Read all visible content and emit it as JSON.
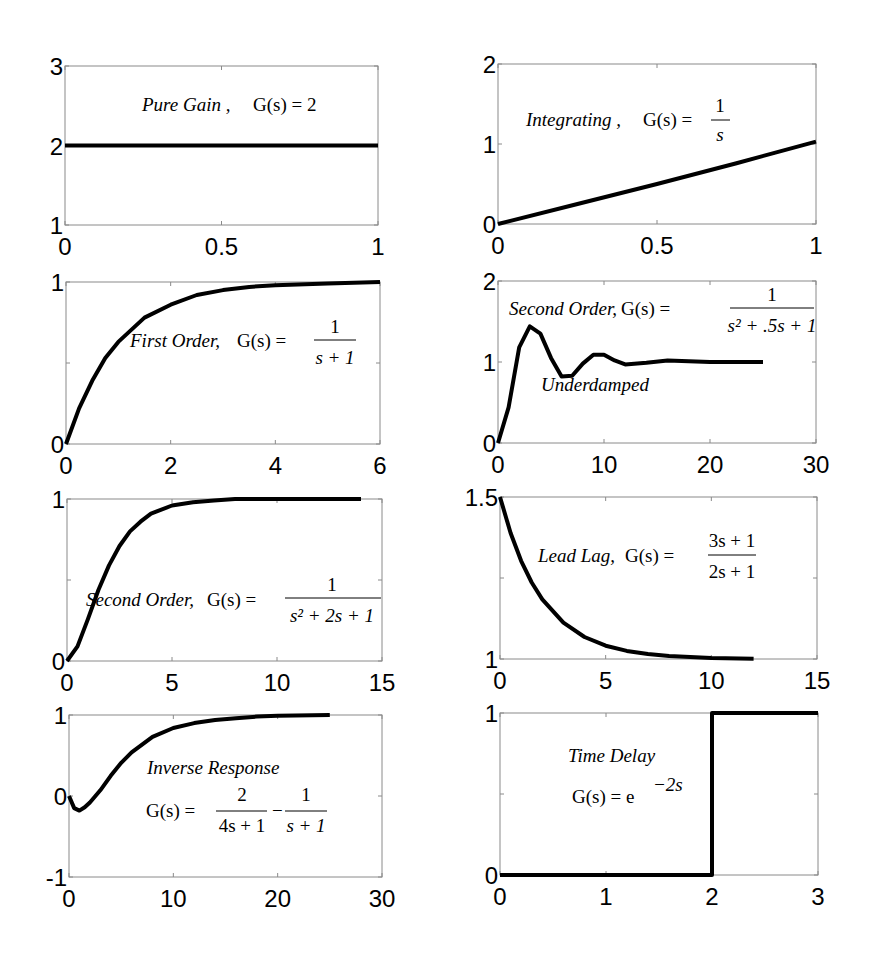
{
  "figure": {
    "line_color": "#000000",
    "axes_color": "#8a8a8a"
  },
  "chart_data": [
    {
      "id": "pure-gain",
      "type": "line",
      "title": "Pure Gain, G(s) = 2",
      "annotation": {
        "label": "Pure Gain ,",
        "formula": "G(s) = 2"
      },
      "xlim": [
        0,
        1
      ],
      "ylim": [
        1,
        3
      ],
      "xticks": [
        "0",
        "0.5",
        "1"
      ],
      "yticks": [
        "1",
        "2",
        "3"
      ],
      "x": [
        0,
        1
      ],
      "y": [
        2,
        2
      ],
      "grid": false
    },
    {
      "id": "integrating",
      "type": "line",
      "title": "Integrating, G(s) = 1/s",
      "annotation": {
        "label": "Integrating ,",
        "formula": "G(s) =",
        "num": "1",
        "den": "s"
      },
      "xlim": [
        0,
        1
      ],
      "ylim": [
        0,
        2
      ],
      "xticks": [
        "0",
        "0.5",
        "1"
      ],
      "yticks": [
        "0",
        "1",
        "2"
      ],
      "x": [
        0,
        0.25,
        0.5,
        0.75,
        1.0
      ],
      "y": [
        0,
        0.25,
        0.5,
        0.76,
        1.03
      ],
      "grid": false
    },
    {
      "id": "first-order",
      "type": "line",
      "title": "First Order, G(s) = 1/(s+1)",
      "annotation": {
        "label": "First Order,",
        "formula": "G(s) =",
        "num": "1",
        "den": "s + 1"
      },
      "xlim": [
        0,
        6
      ],
      "ylim": [
        0,
        1
      ],
      "xticks": [
        "0",
        "2",
        "4",
        "6"
      ],
      "yticks": [
        "0",
        "1"
      ],
      "x": [
        0,
        0.25,
        0.5,
        0.75,
        1,
        1.5,
        2,
        2.5,
        3,
        3.5,
        4,
        5,
        6
      ],
      "y": [
        0,
        0.22,
        0.39,
        0.53,
        0.63,
        0.78,
        0.86,
        0.92,
        0.95,
        0.97,
        0.98,
        0.99,
        1.0
      ],
      "grid": false
    },
    {
      "id": "second-order-underdamped",
      "type": "line",
      "title": "Second Order, G(s) = 1/(s^2 + .5s + 1)",
      "annotation": {
        "label": "Second Order,",
        "formula": "G(s) =",
        "num": "1",
        "den": "s² + .5s + 1",
        "note": "Underdamped"
      },
      "xlim": [
        0,
        30
      ],
      "ylim": [
        0,
        2
      ],
      "xticks": [
        "0",
        "10",
        "20",
        "30"
      ],
      "yticks": [
        "0",
        "1",
        "2"
      ],
      "x": [
        0,
        1,
        2,
        3,
        4,
        5,
        6,
        7,
        8,
        9,
        10,
        11,
        12,
        14,
        16,
        18,
        20,
        22,
        25
      ],
      "y": [
        0,
        0.44,
        1.18,
        1.44,
        1.35,
        1.05,
        0.82,
        0.83,
        0.98,
        1.09,
        1.09,
        1.02,
        0.97,
        0.99,
        1.02,
        1.01,
        1.0,
        1.0,
        1.0
      ],
      "grid": false
    },
    {
      "id": "second-order-critically-damped",
      "type": "line",
      "title": "Second Order, G(s) = 1/(s^2 + 2s + 1)",
      "annotation": {
        "label": "Second Order,",
        "formula": "G(s) =",
        "num": "1",
        "den": "s² + 2s + 1"
      },
      "xlim": [
        0,
        15
      ],
      "ylim": [
        0,
        1
      ],
      "xticks": [
        "0",
        "5",
        "10",
        "15"
      ],
      "yticks": [
        "0",
        "1"
      ],
      "x": [
        0,
        0.5,
        1,
        1.5,
        2,
        2.5,
        3,
        3.5,
        4,
        5,
        6,
        7,
        8,
        10,
        12,
        14
      ],
      "y": [
        0,
        0.09,
        0.26,
        0.44,
        0.59,
        0.71,
        0.8,
        0.86,
        0.91,
        0.96,
        0.98,
        0.99,
        1.0,
        1.0,
        1.0,
        1.0
      ],
      "grid": false
    },
    {
      "id": "lead-lag",
      "type": "line",
      "title": "Lead Lag, G(s) = (3s+1)/(2s+1)",
      "annotation": {
        "label": "Lead Lag,",
        "formula": "G(s) =",
        "num": "3s + 1",
        "den": "2s + 1"
      },
      "xlim": [
        0,
        15
      ],
      "ylim": [
        1,
        1.5
      ],
      "xticks": [
        "0",
        "5",
        "10",
        "15"
      ],
      "yticks": [
        "1",
        "1.5"
      ],
      "x": [
        0,
        0.5,
        1,
        1.5,
        2,
        3,
        4,
        5,
        6,
        7,
        8,
        10,
        12
      ],
      "y": [
        1.5,
        1.389,
        1.303,
        1.236,
        1.184,
        1.112,
        1.068,
        1.041,
        1.025,
        1.015,
        1.009,
        1.003,
        1.001
      ],
      "grid": false
    },
    {
      "id": "inverse-response",
      "type": "line",
      "title": "Inverse Response, G(s) = 2/(4s+1) - 1/(s+1)",
      "annotation": {
        "label": "Inverse Response",
        "formula": "G(s) =",
        "num1": "2",
        "den1": "4s + 1",
        "minus": "−",
        "num2": "1",
        "den2": "s + 1"
      },
      "xlim": [
        0,
        30
      ],
      "ylim": [
        -1,
        1
      ],
      "xticks": [
        "0",
        "10",
        "20",
        "30"
      ],
      "yticks": [
        "-1",
        "0",
        "1"
      ],
      "x": [
        0,
        0.5,
        1,
        1.5,
        2,
        3,
        4,
        5,
        6,
        8,
        10,
        12,
        14,
        16,
        18,
        20,
        25
      ],
      "y": [
        0,
        -0.15,
        -0.18,
        -0.14,
        -0.08,
        0.07,
        0.25,
        0.41,
        0.54,
        0.73,
        0.84,
        0.9,
        0.94,
        0.96,
        0.98,
        0.99,
        1.0
      ],
      "grid": false
    },
    {
      "id": "time-delay",
      "type": "line",
      "title": "Time Delay, G(s) = e^-2s",
      "annotation": {
        "label": "Time Delay",
        "formula": "G(s) = e",
        "exponent": "−2s"
      },
      "xlim": [
        0,
        3
      ],
      "ylim": [
        0,
        1
      ],
      "xticks": [
        "0",
        "1",
        "2",
        "3"
      ],
      "yticks": [
        "0",
        "1"
      ],
      "x": [
        0,
        2,
        2,
        3
      ],
      "y": [
        0,
        0,
        1,
        1
      ],
      "grid": false
    }
  ]
}
